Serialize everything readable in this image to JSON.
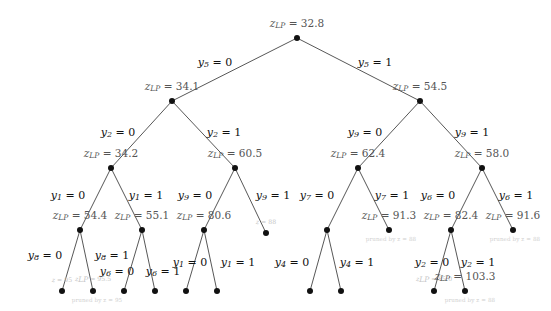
{
  "figure": {
    "type": "branch-and-bound-tree",
    "incumbent_values": [
      "95",
      "88"
    ],
    "colors": {
      "node": "#111111",
      "edge": "#444444",
      "bound_label": "#555555",
      "pruned_label": "#c9c9c9"
    }
  },
  "nodes": [
    {
      "id": "n0",
      "x": 297,
      "y": 38,
      "bound": "z_LP = 32.8",
      "z": "z",
      "sub": "LP",
      "val": "32.8",
      "faded": false,
      "pruned": null
    },
    {
      "id": "n1",
      "x": 172,
      "y": 101,
      "bound": "z_LP = 34.1",
      "z": "z",
      "sub": "LP",
      "val": "34.1",
      "faded": false,
      "pruned": null
    },
    {
      "id": "n2",
      "x": 420,
      "y": 101,
      "bound": "z_LP = 54.5",
      "z": "z",
      "sub": "LP",
      "val": "54.5",
      "faded": false,
      "pruned": null
    },
    {
      "id": "n3",
      "x": 111,
      "y": 168,
      "bound": "z_LP = 34.2",
      "z": "z",
      "sub": "LP",
      "val": "34.2",
      "faded": false,
      "pruned": null
    },
    {
      "id": "n4",
      "x": 235,
      "y": 168,
      "bound": "z_LP = 60.5",
      "z": "z",
      "sub": "LP",
      "val": "60.5",
      "faded": false,
      "pruned": null
    },
    {
      "id": "n5",
      "x": 358,
      "y": 168,
      "bound": "z_LP = 62.4",
      "z": "z",
      "sub": "LP",
      "val": "62.4",
      "faded": false,
      "pruned": null
    },
    {
      "id": "n6",
      "x": 482,
      "y": 168,
      "bound": "z_LP = 58.0",
      "z": "z",
      "sub": "LP",
      "val": "58.0",
      "faded": false,
      "pruned": null
    },
    {
      "id": "n7",
      "x": 80,
      "y": 230,
      "bound": "z_LP = 54.4",
      "z": "z",
      "sub": "LP",
      "val": "54.4",
      "faded": false,
      "pruned": null
    },
    {
      "id": "n8",
      "x": 142,
      "y": 230,
      "bound": "z_LP = 55.1",
      "z": "z",
      "sub": "LP",
      "val": "55.1",
      "faded": false,
      "pruned": null
    },
    {
      "id": "n9",
      "x": 204,
      "y": 230,
      "bound": "z_LP = 80.6",
      "z": "z",
      "sub": "LP",
      "val": "80.6",
      "faded": false,
      "pruned": null
    },
    {
      "id": "n10",
      "x": 266,
      "y": 233,
      "bound": "z = 88",
      "z": "z",
      "sub": "",
      "val": "88",
      "faded": true,
      "pruned": null
    },
    {
      "id": "n11",
      "x": 327,
      "y": 230,
      "bound": "",
      "z": "",
      "sub": "",
      "val": "",
      "faded": false,
      "pruned": null
    },
    {
      "id": "n12",
      "x": 389,
      "y": 230,
      "bound": "z_LP = 91.3",
      "z": "z",
      "sub": "LP",
      "val": "91.3",
      "faded": false,
      "pruned": "pruned by z = 88"
    },
    {
      "id": "n13",
      "x": 451,
      "y": 230,
      "bound": "z_LP = 82.4",
      "z": "z",
      "sub": "LP",
      "val": "82.4",
      "faded": false,
      "pruned": null
    },
    {
      "id": "n14",
      "x": 513,
      "y": 230,
      "bound": "z_LP = 91.6",
      "z": "z",
      "sub": "LP",
      "val": "91.6",
      "faded": false,
      "pruned": "pruned by z = 88"
    },
    {
      "id": "n15",
      "x": 62,
      "y": 291,
      "bound": "z = 95",
      "z": "z",
      "sub": "",
      "val": "95",
      "faded": true,
      "pruned": null
    },
    {
      "id": "n16",
      "x": 93,
      "y": 291,
      "bound": "z_LP = 95.5",
      "z": "z",
      "sub": "LP",
      "val": "95.5",
      "faded": true,
      "pruned": "pruned by z = 95"
    },
    {
      "id": "n17",
      "x": 124,
      "y": 291,
      "bound": "",
      "z": "",
      "sub": "",
      "val": "",
      "faded": false,
      "pruned": null
    },
    {
      "id": "n18",
      "x": 155,
      "y": 291,
      "bound": "",
      "z": "",
      "sub": "",
      "val": "",
      "faded": false,
      "pruned": null
    },
    {
      "id": "n19",
      "x": 186,
      "y": 291,
      "bound": "",
      "z": "",
      "sub": "",
      "val": "",
      "faded": false,
      "pruned": null
    },
    {
      "id": "n20",
      "x": 217,
      "y": 291,
      "bound": "",
      "z": "",
      "sub": "",
      "val": "",
      "faded": false,
      "pruned": null
    },
    {
      "id": "n21",
      "x": 310,
      "y": 291,
      "bound": "",
      "z": "",
      "sub": "",
      "val": "",
      "faded": false,
      "pruned": null
    },
    {
      "id": "n22",
      "x": 341,
      "y": 291,
      "bound": "",
      "z": "",
      "sub": "",
      "val": "",
      "faded": false,
      "pruned": null
    },
    {
      "id": "n23",
      "x": 434,
      "y": 291,
      "bound": "z_LP = 85.0",
      "z": "z",
      "sub": "LP",
      "val": "85.0",
      "faded": true,
      "pruned": null
    },
    {
      "id": "n24",
      "x": 465,
      "y": 291,
      "bound": "z_LP = 103.3",
      "z": "z",
      "sub": "LP",
      "val": "103.3",
      "faded": false,
      "pruned": "pruned by z = 88"
    }
  ],
  "edges": [
    {
      "from": "n0",
      "to": "n1",
      "label": "y_5 = 0",
      "var": "y",
      "sub": "5",
      "value": "0",
      "lx": 215,
      "ly": 63
    },
    {
      "from": "n0",
      "to": "n2",
      "label": "y_5 = 1",
      "var": "y",
      "sub": "5",
      "value": "1",
      "lx": 375,
      "ly": 63
    },
    {
      "from": "n1",
      "to": "n3",
      "label": "y_2 = 0",
      "var": "y",
      "sub": "2",
      "value": "0",
      "lx": 118,
      "ly": 133
    },
    {
      "from": "n1",
      "to": "n4",
      "label": "y_2 = 1",
      "var": "y",
      "sub": "2",
      "value": "1",
      "lx": 224,
      "ly": 133
    },
    {
      "from": "n2",
      "to": "n5",
      "label": "y_9 = 0",
      "var": "y",
      "sub": "9",
      "value": "0",
      "lx": 365,
      "ly": 133
    },
    {
      "from": "n2",
      "to": "n6",
      "label": "y_9 = 1",
      "var": "y",
      "sub": "9",
      "value": "1",
      "lx": 472,
      "ly": 133
    },
    {
      "from": "n3",
      "to": "n7",
      "label": "y_1 = 0",
      "var": "y",
      "sub": "1",
      "value": "0",
      "lx": 68,
      "ly": 196
    },
    {
      "from": "n3",
      "to": "n8",
      "label": "y_1 = 1",
      "var": "y",
      "sub": "1",
      "value": "1",
      "lx": 146,
      "ly": 196
    },
    {
      "from": "n4",
      "to": "n9",
      "label": "y_9 = 0",
      "var": "y",
      "sub": "9",
      "value": "0",
      "lx": 195,
      "ly": 196
    },
    {
      "from": "n4",
      "to": "n10",
      "label": "y_9 = 1",
      "var": "y",
      "sub": "9",
      "value": "1",
      "lx": 273,
      "ly": 196
    },
    {
      "from": "n5",
      "to": "n11",
      "label": "y_7 = 0",
      "var": "y",
      "sub": "7",
      "value": "0",
      "lx": 317,
      "ly": 196
    },
    {
      "from": "n5",
      "to": "n12",
      "label": "y_7 = 1",
      "var": "y",
      "sub": "7",
      "value": "1",
      "lx": 392,
      "ly": 196
    },
    {
      "from": "n6",
      "to": "n13",
      "label": "y_6 = 0",
      "var": "y",
      "sub": "6",
      "value": "0",
      "lx": 438,
      "ly": 196
    },
    {
      "from": "n6",
      "to": "n14",
      "label": "y_6 = 1",
      "var": "y",
      "sub": "6",
      "value": "1",
      "lx": 516,
      "ly": 196
    },
    {
      "from": "n7",
      "to": "n15",
      "label": "y_8 = 0",
      "var": "y",
      "sub": "8",
      "value": "0",
      "lx": 45,
      "ly": 256
    },
    {
      "from": "n7",
      "to": "n16",
      "label": "y_8 = 1",
      "var": "y",
      "sub": "8",
      "value": "1",
      "lx": 112,
      "ly": 256
    },
    {
      "from": "n8",
      "to": "n17",
      "label": "y_6 = 0",
      "var": "y",
      "sub": "6",
      "value": "0",
      "lx": 117,
      "ly": 272
    },
    {
      "from": "n8",
      "to": "n18",
      "label": "y_6 = 1",
      "var": "y",
      "sub": "6",
      "value": "1",
      "lx": 163,
      "ly": 272
    },
    {
      "from": "n9",
      "to": "n19",
      "label": "y_1 = 0",
      "var": "y",
      "sub": "1",
      "value": "0",
      "lx": 190,
      "ly": 263
    },
    {
      "from": "n9",
      "to": "n20",
      "label": "y_1 = 1",
      "var": "y",
      "sub": "1",
      "value": "1",
      "lx": 238,
      "ly": 263
    },
    {
      "from": "n11",
      "to": "n21",
      "label": "y_4 = 0",
      "var": "y",
      "sub": "4",
      "value": "0",
      "lx": 292,
      "ly": 263
    },
    {
      "from": "n11",
      "to": "n22",
      "label": "y_4 = 1",
      "var": "y",
      "sub": "4",
      "value": "1",
      "lx": 357,
      "ly": 263
    },
    {
      "from": "n13",
      "to": "n23",
      "label": "y_2 = 0",
      "var": "y",
      "sub": "2",
      "value": "0",
      "lx": 432,
      "ly": 263
    },
    {
      "from": "n13",
      "to": "n24",
      "label": "y_2 = 1",
      "var": "y",
      "sub": "2",
      "value": "1",
      "lx": 478,
      "ly": 263
    }
  ],
  "prune_notes": [
    {
      "text": "pruned by z = 95",
      "x": 97,
      "y": 301
    },
    {
      "text": "pruned by z = 88",
      "x": 391,
      "y": 240
    },
    {
      "text": "pruned by z = 88",
      "x": 515,
      "y": 240
    },
    {
      "text": "pruned by z = 88",
      "x": 470,
      "y": 301
    }
  ]
}
